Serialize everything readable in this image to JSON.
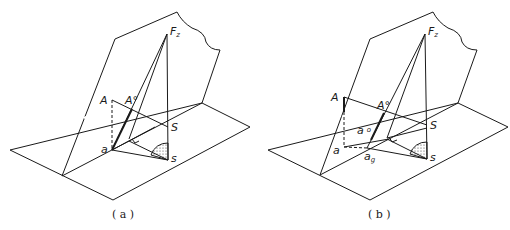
{
  "figure": {
    "panels": [
      {
        "id": "a",
        "caption": "( a )",
        "labels": {
          "Fz": "F",
          "Fz_sub": "z",
          "A": "A",
          "A0": "A°",
          "S_upper": "S",
          "a": "a",
          "s_lower": "s"
        }
      },
      {
        "id": "b",
        "caption": "( b )",
        "labels": {
          "Fz": "F",
          "Fz_sub": "z",
          "A": "A",
          "A0": "A°",
          "S_upper": "S",
          "a0": "a",
          "a0_sup": "o",
          "a": "a",
          "ag": "a",
          "ag_sub": "g",
          "s_lower": "s"
        }
      }
    ],
    "colors": {
      "line": "#1a1a1a",
      "background": "#ffffff"
    }
  }
}
